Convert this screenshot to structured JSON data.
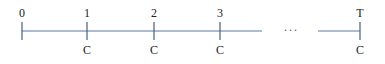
{
  "diagram": {
    "type": "cash-flow-timeline",
    "points": [
      {
        "period": "0",
        "flow": ""
      },
      {
        "period": "1",
        "flow": "C"
      },
      {
        "period": "2",
        "flow": "C"
      },
      {
        "period": "3",
        "flow": "C"
      },
      {
        "period": "T",
        "flow": "C"
      }
    ],
    "ellipsis": "···",
    "colors": {
      "axis": "#5b79a8",
      "text": "#222222"
    }
  }
}
